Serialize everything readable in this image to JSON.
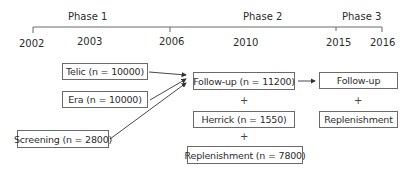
{
  "timeline": {
    "phases": [
      {
        "label": "Phase 1"
      },
      {
        "label": "Phase 2"
      },
      {
        "label": "Phase 3"
      }
    ],
    "years": [
      "2002",
      "2003",
      "2006",
      "2010",
      "2015",
      "2016"
    ]
  },
  "boxes": {
    "telic": "Telic (n = 10000)",
    "era": "Era (n = 10000)",
    "screening": "Screening (n = 2800)",
    "followup_phase2": "Follow-up (n = 11200)",
    "herrick": "Herrick (n = 1550)",
    "replenishment_phase2": "Replenishment (n = 7800)",
    "followup_phase3": "Follow-up",
    "replenishment_phase3": "Replenishment"
  },
  "connectors": {
    "plus": "+"
  },
  "colors": {
    "line": "#6a6a6a",
    "text": "#2b2b2b"
  }
}
